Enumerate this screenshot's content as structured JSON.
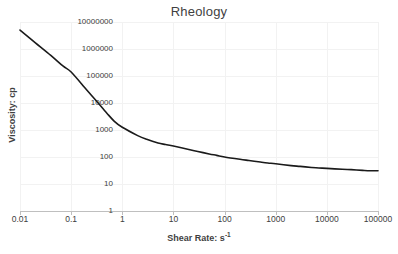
{
  "chart_data": {
    "type": "line",
    "title": "Rheology",
    "xlabel": "Shear Rate: s",
    "xlabel_superscript": "-1",
    "ylabel": "Viscosity: cp",
    "xscale": "log",
    "yscale": "log",
    "xlim": [
      0.01,
      100000
    ],
    "ylim": [
      1,
      10000000
    ],
    "xticks": [
      "0.01",
      "0.1",
      "1",
      "10",
      "100",
      "1000",
      "10000",
      "100000"
    ],
    "xtick_values": [
      0.01,
      0.1,
      1,
      10,
      100,
      1000,
      10000,
      100000
    ],
    "yticks": [
      "1",
      "10",
      "100",
      "1000",
      "10000",
      "100000",
      "1000000",
      "10000000"
    ],
    "ytick_values": [
      1,
      10,
      100,
      1000,
      10000,
      100000,
      1000000,
      10000000
    ],
    "grid": true,
    "legend": null,
    "series": [
      {
        "name": "Viscosity",
        "color": "#1a1a1a",
        "line_width": 1.6,
        "x": [
          0.01,
          0.02,
          0.04,
          0.07,
          0.1,
          0.2,
          0.3,
          0.5,
          0.7,
          1,
          2,
          3,
          5,
          7,
          10,
          20,
          30,
          50,
          70,
          100,
          200,
          300,
          500,
          700,
          1000,
          2000,
          3000,
          5000,
          7000,
          10000,
          20000,
          30000,
          50000,
          70000,
          100000
        ],
        "y": [
          5000000,
          1700000,
          580000,
          230000,
          140000,
          31000,
          13000,
          4200,
          2100,
          1260,
          620,
          450,
          330,
          290,
          255,
          190,
          160,
          130,
          115,
          100,
          82,
          74,
          65,
          60,
          56,
          48,
          45,
          41,
          39,
          38,
          35,
          34,
          32,
          31,
          31
        ]
      }
    ]
  },
  "axis_colors": {
    "axis_line": "#bfbfbf",
    "grid_line": "#f2f2f2",
    "text": "#404040",
    "series": "#1a1a1a"
  }
}
